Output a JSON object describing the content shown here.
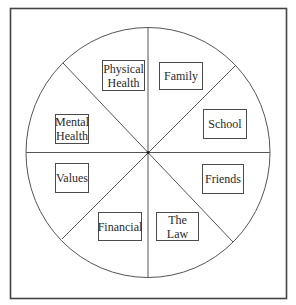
{
  "diagram": {
    "type": "wheel",
    "segments": 8,
    "colors": {
      "line": "#555555",
      "frame": "#444444",
      "text": "#2a2a2a",
      "background": "#ffffff"
    },
    "labels": [
      {
        "id": "physical-health",
        "text": "Physical\nHealth"
      },
      {
        "id": "family",
        "text": "Family"
      },
      {
        "id": "school",
        "text": "School"
      },
      {
        "id": "friends",
        "text": "Friends"
      },
      {
        "id": "the-law",
        "text": "The Law"
      },
      {
        "id": "financial",
        "text": "Financial"
      },
      {
        "id": "values",
        "text": "Values"
      },
      {
        "id": "mental-health",
        "text": "Mental\nHealth"
      }
    ]
  }
}
